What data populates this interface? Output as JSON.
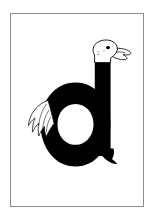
{
  "card": {
    "type": "alphabet-flashcard",
    "letter": "d",
    "letter_case": "lowercase",
    "subject": "duck",
    "description": "Lowercase letter d drawn as a duck: the ascender is the neck topped by a duck head facing right, a feathered wing sits at the left of the bowl, and a small tail flick trails from the bottom of the stem.",
    "frame": {
      "border_color": "#8d8d8d",
      "background_color": "#ffffff"
    },
    "colors": {
      "ink": "#000000",
      "paper": "#ffffff",
      "outline": "#1a1a1a",
      "beak_fill": "#ffffff",
      "eye": "#000000"
    },
    "parts": [
      {
        "name": "letter-body",
        "label": "d"
      },
      {
        "name": "duck-head",
        "label": "duck head"
      },
      {
        "name": "duck-beak",
        "label": "beak"
      },
      {
        "name": "duck-eye",
        "label": "eye"
      },
      {
        "name": "duck-wing",
        "label": "wing"
      },
      {
        "name": "duck-tail",
        "label": "tail"
      }
    ]
  }
}
